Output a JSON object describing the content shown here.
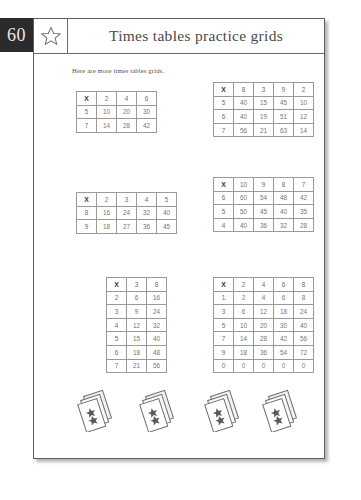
{
  "page": {
    "number": "60",
    "star_icon": "star-outline-icon"
  },
  "header": {
    "title": "Times tables practice grids"
  },
  "intro": {
    "text": "Here are more times tables grids."
  },
  "colors": {
    "badge_bg": "#2b2b2b",
    "badge_text": "#e9e9e9",
    "page_border": "#5d5d5d",
    "grid_line": "#9a9a9a",
    "title_text": "#4a4a4a",
    "cell_text": "#777777"
  },
  "grids": [
    {
      "name": "grid-1",
      "corner": "X",
      "columns": [
        "2",
        "4",
        "6"
      ],
      "rows": [
        {
          "head": "5",
          "cells": [
            "10",
            "20",
            "30"
          ]
        },
        {
          "head": "7",
          "cells": [
            "14",
            "28",
            "42"
          ]
        }
      ]
    },
    {
      "name": "grid-2",
      "corner": "X",
      "columns": [
        "8",
        "3",
        "9",
        "2"
      ],
      "rows": [
        {
          "head": "5",
          "cells": [
            "40",
            "15",
            "45",
            "10"
          ]
        },
        {
          "head": "6",
          "cells": [
            "40",
            "19",
            "51",
            "12"
          ]
        },
        {
          "head": "7",
          "cells": [
            "56",
            "21",
            "63",
            "14"
          ]
        }
      ]
    },
    {
      "name": "grid-3",
      "corner": "X",
      "columns": [
        "2",
        "3",
        "4",
        "5"
      ],
      "rows": [
        {
          "head": "8",
          "cells": [
            "16",
            "24",
            "32",
            "40"
          ]
        },
        {
          "head": "9",
          "cells": [
            "18",
            "27",
            "36",
            "45"
          ]
        }
      ]
    },
    {
      "name": "grid-4",
      "corner": "X",
      "columns": [
        "10",
        "9",
        "8",
        "7"
      ],
      "rows": [
        {
          "head": "6",
          "cells": [
            "60",
            "54",
            "48",
            "42"
          ]
        },
        {
          "head": "5",
          "cells": [
            "50",
            "45",
            "40",
            "35"
          ]
        },
        {
          "head": "4",
          "cells": [
            "40",
            "36",
            "32",
            "28"
          ]
        }
      ]
    },
    {
      "name": "grid-5",
      "corner": "X",
      "columns": [
        "3",
        "8"
      ],
      "rows": [
        {
          "head": "2",
          "cells": [
            "6",
            "16"
          ]
        },
        {
          "head": "3",
          "cells": [
            "9",
            "24"
          ]
        },
        {
          "head": "4",
          "cells": [
            "12",
            "32"
          ]
        },
        {
          "head": "5",
          "cells": [
            "15",
            "40"
          ]
        },
        {
          "head": "6",
          "cells": [
            "18",
            "48"
          ]
        },
        {
          "head": "7",
          "cells": [
            "21",
            "56"
          ]
        }
      ]
    },
    {
      "name": "grid-6",
      "corner": "X",
      "columns": [
        "2",
        "4",
        "6",
        "8"
      ],
      "rows": [
        {
          "head": "1",
          "cells": [
            "2",
            "4",
            "6",
            "8"
          ]
        },
        {
          "head": "3",
          "cells": [
            "6",
            "12",
            "18",
            "24"
          ]
        },
        {
          "head": "5",
          "cells": [
            "10",
            "20",
            "30",
            "40"
          ]
        },
        {
          "head": "7",
          "cells": [
            "14",
            "28",
            "42",
            "56"
          ]
        },
        {
          "head": "9",
          "cells": [
            "18",
            "36",
            "54",
            "72"
          ]
        },
        {
          "head": "0",
          "cells": [
            "0",
            "0",
            "0",
            "0"
          ]
        }
      ]
    }
  ],
  "decorations": {
    "count": 4,
    "icon": "stacked-cards-icon"
  }
}
